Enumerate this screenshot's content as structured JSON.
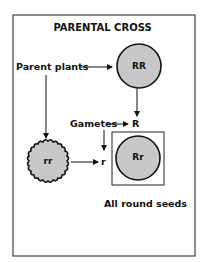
{
  "diagram": {
    "title": "PARENTAL CROSS",
    "labels": {
      "parent_plants": "Parent plants",
      "gametes": "Gametes",
      "gamete_dominant": "R",
      "gamete_recessive": "r",
      "result": "All round seeds"
    },
    "nodes": {
      "parent_round": {
        "genotype": "RR",
        "shape": "round"
      },
      "parent_wrinkled": {
        "genotype": "rr",
        "shape": "wrinkled"
      },
      "offspring": {
        "genotype": "Rr",
        "shape": "round"
      }
    },
    "colors": {
      "seed_fill": "#c8c8c8",
      "stroke": "#111111",
      "background": "#ffffff"
    }
  }
}
